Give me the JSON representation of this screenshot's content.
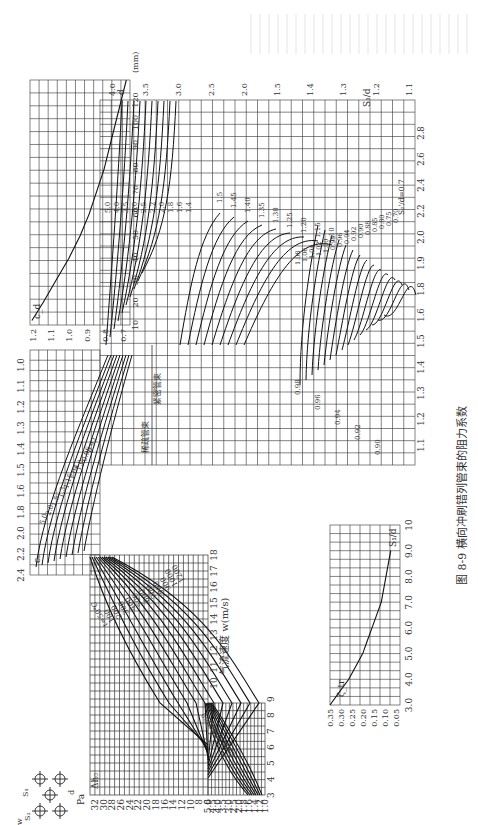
{
  "figure": {
    "number": "图 8-9",
    "caption": "横向冲刷错列管束的阻力系数",
    "orientation": "rotated 90° counter-clockwise"
  },
  "labels": {
    "pa": "Pa",
    "dh": "Δh₀",
    "velocity_axis": "气流速度 w(m/s)",
    "temp_curve": "气流温度 t=50℃",
    "cs": "cₛ",
    "cd": "c_d",
    "d_mm": "(mm)",
    "d": "d",
    "zeta": "ζ_tr",
    "s1d": "S₁/d",
    "s2d_label": "S₂/d=5.0",
    "arrow_left": "稀疏管束",
    "arrow_right": "紧密管束",
    "diagram": {
      "s1": "S₁",
      "s2": "S₂",
      "s1p": "S₁'",
      "d": "d",
      "w": "w"
    }
  },
  "chart_data": [
    {
      "id": "dh_vs_velocity",
      "type": "line",
      "title": "Δh₀ (Pa) vs 气流速度 w (m/s), by temperature t (℃)",
      "xlabel": "气流速度 w(m/s)",
      "ylabel": "Δh₀ (Pa)",
      "x_ticks": [
        3,
        4,
        5,
        6,
        7,
        8,
        9,
        10,
        11,
        12,
        13,
        14,
        15,
        16,
        17,
        18
      ],
      "y_ticks_lower": [
        1.0,
        1.2,
        1.4,
        1.6,
        1.8,
        2.0,
        2.5,
        3.0,
        3.5,
        4.0,
        4.5,
        5.0
      ],
      "y_ticks_upper": [
        6,
        8,
        10,
        12,
        14,
        16,
        18,
        20,
        22,
        24,
        26,
        28,
        30,
        32
      ],
      "series_labels": [
        "t=50℃",
        "100",
        "200",
        "300",
        "400",
        "500",
        "600",
        "700",
        "800",
        "900",
        "1000",
        "1200"
      ],
      "lower_series_labels": [
        "50",
        "200",
        "300",
        "400",
        "500",
        "700",
        "900",
        "1200"
      ]
    },
    {
      "id": "cs_correction",
      "type": "line",
      "title": "cₛ vs S₁/d, by S₂'/d",
      "xlabel": "S₁/d",
      "ylabel": "cₛ",
      "x_ticks": [
        1.1,
        1.2,
        1.3,
        1.4,
        1.5,
        2.0,
        2.5,
        3.0,
        3.5,
        4.0
      ],
      "y_ticks_upper": [
        2.4,
        2.2,
        2.0,
        1.8,
        1.6,
        1.5,
        1.4,
        1.3,
        1.2,
        1.1,
        1.0
      ],
      "y_ticks_lower": [
        1.1,
        1.2,
        1.3,
        1.4,
        1.5,
        1.6,
        1.8,
        1.9,
        2.0,
        2.2,
        2.4,
        2.6,
        2.8
      ],
      "curve_labels_left": [
        "5.0",
        "2.0",
        "1.5",
        "1.3",
        "1.15",
        "1.04",
        "1.0",
        "0.96",
        "0.92"
      ],
      "curve_labels_mid": [
        "5.0",
        "4.0",
        "3.5",
        "3.0",
        "2.5",
        "2.2",
        "2.0",
        "1.8",
        "1.6",
        "1.4"
      ],
      "curve_labels_upper": [
        "1.5",
        "1.45",
        "1.40",
        "1.35",
        "1.30",
        "1.25",
        "1.20",
        "1.15",
        "1.10"
      ],
      "curve_labels_lower": [
        "1.08",
        "1.06",
        "1.04",
        "1.02",
        "1.00",
        "0.98",
        "0.96",
        "0.94",
        "0.92",
        "0.90",
        "0.88",
        "0.85",
        "0.80",
        "0.75",
        "0.70",
        "0.98",
        "0.96",
        "0.94",
        "0.92",
        "0.90"
      ],
      "annotation": "S₂'/d=0.7"
    },
    {
      "id": "cd_vs_d",
      "type": "line",
      "title": "c_d vs d (mm)",
      "xlabel": "d (mm)",
      "ylabel": "c_d",
      "x_ticks": [
        10,
        20,
        30,
        40,
        50,
        60,
        70,
        80,
        90,
        100,
        120
      ],
      "y_ticks": [
        1.2,
        1.1,
        1.0,
        0.9,
        0.8,
        0.7
      ],
      "x": [
        12,
        20,
        30,
        40,
        50,
        60,
        70,
        80,
        90,
        100,
        120
      ],
      "y": [
        1.21,
        1.15,
        1.08,
        1.01,
        0.95,
        0.9,
        0.86,
        0.82,
        0.79,
        0.76,
        0.7
      ]
    },
    {
      "id": "zeta_vs_s1d",
      "type": "line",
      "title": "ζ_tr vs S₁/d",
      "xlabel": "S₁/d",
      "ylabel": "ζ_tr",
      "x_ticks": [
        3.0,
        4.0,
        5.0,
        6.0,
        7.0,
        8.0,
        9.0,
        10
      ],
      "y_ticks": [
        0.35,
        0.3,
        0.25,
        0.2,
        0.15,
        0.1,
        0.05
      ],
      "x": [
        3.0,
        3.5,
        4.0,
        4.5,
        5.0,
        5.5,
        6.0,
        7.0,
        8.0,
        9.0
      ],
      "y": [
        0.35,
        0.31,
        0.27,
        0.24,
        0.21,
        0.19,
        0.17,
        0.13,
        0.11,
        0.09
      ]
    }
  ]
}
